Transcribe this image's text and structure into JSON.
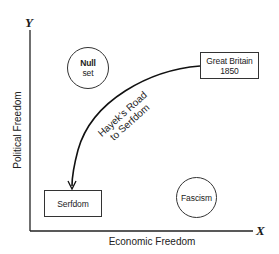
{
  "diagram": {
    "type": "conceptual-2d-plot",
    "axes": {
      "y": {
        "letter": "Y",
        "label": "Political Freedom"
      },
      "x": {
        "letter": "X",
        "label": "Economic Freedom"
      }
    },
    "nodes": {
      "null_set": {
        "shape": "circle",
        "line1": "Null",
        "line2": "set"
      },
      "great_britain": {
        "shape": "rectangle",
        "line1": "Great Britain",
        "line2": "1850"
      },
      "serfdom": {
        "shape": "rectangle",
        "line1": "Serfdom"
      },
      "fascism": {
        "shape": "circle",
        "line1": "Fascism"
      }
    },
    "path": {
      "from": "Great Britain 1850",
      "to": "Serfdom",
      "line1": "Hayek's Road",
      "line2": "to Serfdom",
      "arrow": "arrowhead-at-serfdom"
    },
    "colors": {
      "line": "#222222",
      "background": "#ffffff",
      "text": "#222222"
    }
  }
}
